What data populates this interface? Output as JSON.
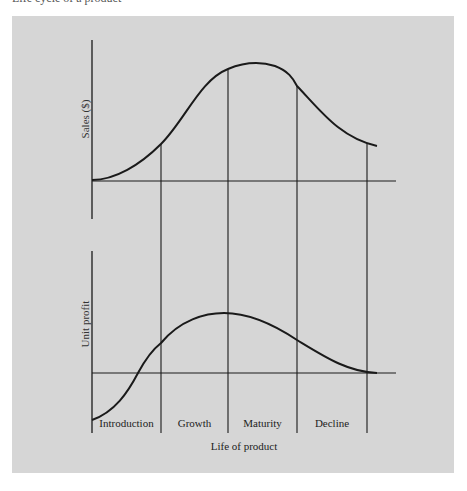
{
  "caption_clipped": "Life cycle of a product",
  "diagram": {
    "colors": {
      "panel_background": "#d6d6d6",
      "line_color": "#1a1a1a",
      "page_background": "#ffffff"
    },
    "top_chart": {
      "ylabel": "Sales ($)",
      "curve": "bell-shaped sales curve rising through introduction and growth, peaking in maturity, declining afterwards"
    },
    "bottom_chart": {
      "ylabel": "Unit profit",
      "curve": "profit starts negative in introduction, crosses zero, peaks at end of growth, falls back to zero at end of decline"
    },
    "xlabel": "Life of product",
    "stages": [
      {
        "label": "Introduction"
      },
      {
        "label": "Growth"
      },
      {
        "label": "Maturity"
      },
      {
        "label": "Decline"
      }
    ]
  }
}
